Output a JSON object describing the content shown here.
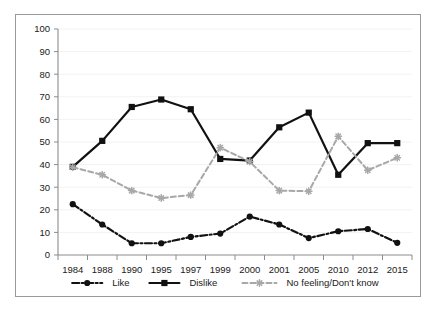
{
  "chart_data": {
    "type": "line",
    "title": "",
    "subtitle": "",
    "xlabel": "",
    "ylabel": "",
    "categories": [
      "1984",
      "1988",
      "1990",
      "1995",
      "1997",
      "1999",
      "2000",
      "2001",
      "2005",
      "2010",
      "2012",
      "2015"
    ],
    "ylim": [
      0,
      100
    ],
    "ytick_step": 10,
    "yticks": [
      "0",
      "10",
      "20",
      "30",
      "40",
      "50",
      "60",
      "70",
      "80",
      "90",
      "100"
    ],
    "grid": "horizontal-light",
    "legend_position": "bottom",
    "series": [
      {
        "name": "Like",
        "color": "#111111",
        "line_style": "dash-dot",
        "marker": "circle",
        "values": [
          22.5,
          13.5,
          5.2,
          5.2,
          8.0,
          9.5,
          17.0,
          13.5,
          7.5,
          10.5,
          11.5,
          5.4
        ]
      },
      {
        "name": "Dislike",
        "color": "#111111",
        "line_style": "solid",
        "marker": "square",
        "values": [
          39.0,
          50.5,
          65.5,
          68.8,
          64.5,
          42.5,
          41.8,
          56.5,
          63.0,
          35.5,
          49.5,
          49.5
        ]
      },
      {
        "name": "No feeling/Don't know",
        "color": "#a8a8a8",
        "line_style": "dashed",
        "marker": "star",
        "values": [
          38.8,
          35.5,
          28.5,
          25.2,
          26.5,
          47.5,
          41.3,
          28.5,
          28.2,
          52.5,
          37.5,
          43.0
        ]
      }
    ],
    "legend": [
      {
        "label": "Like",
        "color": "#111111",
        "marker": "circle",
        "line_style": "dash-dot"
      },
      {
        "label": "Dislike",
        "color": "#111111",
        "marker": "square",
        "line_style": "solid"
      },
      {
        "label": "No feeling/Don't know",
        "color": "#a8a8a8",
        "marker": "star",
        "line_style": "dashed"
      }
    ],
    "colors": {
      "axis": "#8c8c8c",
      "grid": "#f2f2f2",
      "border": "#9a9a9a",
      "background": "#ffffff",
      "text": "#1a1a1a"
    }
  }
}
